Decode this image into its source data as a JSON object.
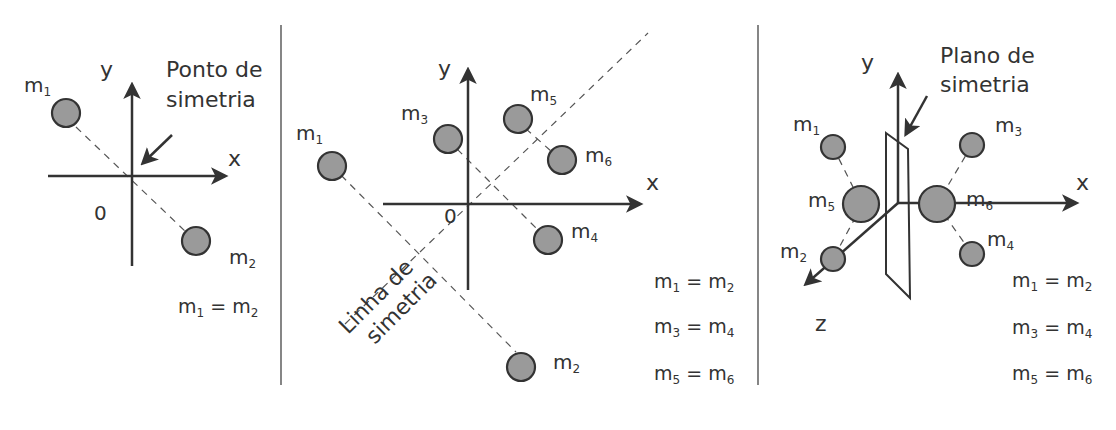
{
  "panels": [
    {
      "id": "point-symmetry",
      "annotation": [
        "Ponto de",
        "simetria"
      ],
      "axes": {
        "x": "x",
        "y": "y",
        "origin": "0"
      },
      "masses": [
        {
          "name": "m",
          "sub": "1"
        },
        {
          "name": "m",
          "sub": "2"
        }
      ],
      "equations": [
        {
          "l": "1",
          "r": "2"
        }
      ]
    },
    {
      "id": "line-symmetry",
      "annotation": [
        "Linha de",
        "simetria"
      ],
      "axes": {
        "x": "x",
        "y": "y",
        "origin": "0"
      },
      "masses": [
        {
          "name": "m",
          "sub": "1"
        },
        {
          "name": "m",
          "sub": "2"
        },
        {
          "name": "m",
          "sub": "3"
        },
        {
          "name": "m",
          "sub": "4"
        },
        {
          "name": "m",
          "sub": "5"
        },
        {
          "name": "m",
          "sub": "6"
        }
      ],
      "equations": [
        {
          "l": "1",
          "r": "2"
        },
        {
          "l": "3",
          "r": "4"
        },
        {
          "l": "5",
          "r": "6"
        }
      ]
    },
    {
      "id": "plane-symmetry",
      "annotation": [
        "Plano de",
        "simetria"
      ],
      "axes": {
        "x": "x",
        "y": "y",
        "z": "z"
      },
      "masses": [
        {
          "name": "m",
          "sub": "1"
        },
        {
          "name": "m",
          "sub": "2"
        },
        {
          "name": "m",
          "sub": "3"
        },
        {
          "name": "m",
          "sub": "4"
        },
        {
          "name": "m",
          "sub": "5"
        },
        {
          "name": "m",
          "sub": "6"
        }
      ],
      "equations": [
        {
          "l": "1",
          "r": "2"
        },
        {
          "l": "3",
          "r": "4"
        },
        {
          "l": "5",
          "r": "6"
        }
      ]
    }
  ],
  "symbols": {
    "m": "m",
    "eq": " = "
  }
}
